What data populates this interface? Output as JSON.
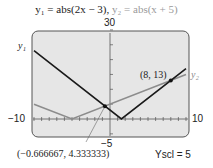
{
  "title": {
    "y1": "y₁ = abs(2x − 3),",
    "y2": "y₂ = abs(x + 5)"
  },
  "window": {
    "ymax_label": "30",
    "ymin_label": "−5",
    "xmin_label": "−10",
    "xmax_label": "10",
    "yscl_label": "Yscl = 5"
  },
  "curve_labels": {
    "y1": "y₁",
    "y2": "y₂"
  },
  "annotations": {
    "point1": "(8, 13)",
    "point2": "(−0.666667, 4.333333)"
  },
  "colors": {
    "screen_bg": "#e6e6e6",
    "y1": "#1a1a1a",
    "y2": "#8c8c8c",
    "frame": "#555555"
  },
  "chart_data": {
    "type": "line",
    "xlim": [
      -10,
      10
    ],
    "ylim": [
      -5,
      30
    ],
    "xscl": 1,
    "yscl": 5,
    "series": [
      {
        "name": "y1 = abs(2x - 3)",
        "x": [
          -10,
          1.5,
          10
        ],
        "y": [
          23,
          0,
          17
        ]
      },
      {
        "name": "y2 = abs(x + 5)",
        "x": [
          -10,
          -5,
          10
        ],
        "y": [
          5,
          0,
          15
        ]
      }
    ],
    "intersections": [
      {
        "x": -0.666667,
        "y": 4.333333
      },
      {
        "x": 8,
        "y": 13
      }
    ],
    "grid": false
  }
}
